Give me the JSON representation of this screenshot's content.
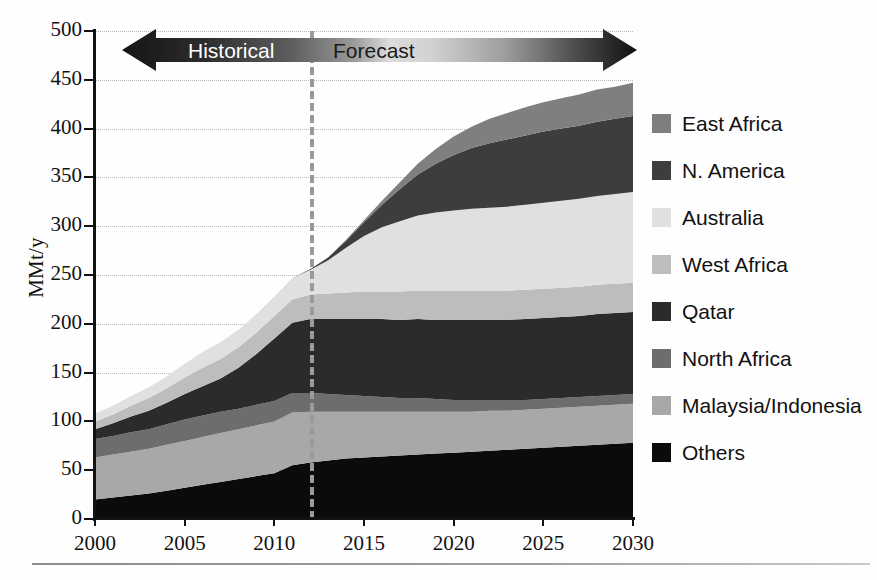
{
  "chart_data": {
    "type": "area",
    "title": "",
    "subtitle": "",
    "xlabel": "",
    "ylabel": "MMt/y",
    "xlim": [
      2000,
      2030
    ],
    "ylim": [
      0,
      500
    ],
    "grid": true,
    "legend_position": "right",
    "stacked": true,
    "x": [
      2000,
      2001,
      2002,
      2003,
      2004,
      2005,
      2006,
      2007,
      2008,
      2009,
      2010,
      2011,
      2012,
      2013,
      2014,
      2015,
      2016,
      2017,
      2018,
      2019,
      2020,
      2021,
      2022,
      2023,
      2024,
      2025,
      2026,
      2027,
      2028,
      2029,
      2030
    ],
    "y_ticks": [
      0,
      50,
      100,
      150,
      200,
      250,
      300,
      350,
      400,
      450,
      500
    ],
    "x_ticks": [
      2000,
      2005,
      2010,
      2015,
      2020,
      2025,
      2030
    ],
    "series": [
      {
        "name": "Others",
        "color": "#0b0b0b",
        "values": [
          20,
          22,
          24,
          26,
          29,
          32,
          35,
          38,
          41,
          44,
          47,
          55,
          58,
          60,
          62,
          63,
          64,
          65,
          66,
          67,
          68,
          69,
          70,
          71,
          72,
          73,
          74,
          75,
          76,
          77,
          78
        ]
      },
      {
        "name": "Malaysia/Indonesia",
        "color": "#a8a8a8",
        "values": [
          43,
          44,
          45,
          46,
          47,
          48,
          49,
          50,
          51,
          52,
          53,
          54,
          52,
          50,
          48,
          47,
          46,
          45,
          44,
          43,
          42,
          41,
          41,
          40,
          40,
          40,
          40,
          40,
          40,
          40,
          40
        ]
      },
      {
        "name": "North Africa",
        "color": "#6d6d6d",
        "values": [
          19,
          19,
          20,
          20,
          21,
          22,
          22,
          22,
          21,
          21,
          21,
          20,
          19,
          18,
          17,
          16,
          15,
          14,
          14,
          13,
          12,
          12,
          11,
          11,
          10,
          10,
          10,
          10,
          10,
          10,
          10
        ]
      },
      {
        "name": "Qatar",
        "color": "#2b2b2b",
        "values": [
          10,
          13,
          16,
          19,
          22,
          26,
          30,
          34,
          42,
          52,
          64,
          72,
          76,
          77,
          78,
          79,
          80,
          80,
          81,
          81,
          82,
          82,
          82,
          82,
          83,
          83,
          83,
          83,
          84,
          84,
          84
        ]
      },
      {
        "name": "West Africa",
        "color": "#bdbdbd",
        "values": [
          8,
          9,
          11,
          13,
          15,
          17,
          19,
          20,
          21,
          22,
          23,
          24,
          25,
          26,
          27,
          28,
          28,
          29,
          29,
          30,
          30,
          30,
          30,
          30,
          30,
          30,
          30,
          30,
          30,
          30,
          30
        ]
      },
      {
        "name": "Australia",
        "color": "#e0e0e0",
        "values": [
          8,
          9,
          10,
          11,
          12,
          14,
          16,
          17,
          18,
          19,
          20,
          22,
          25,
          34,
          46,
          57,
          66,
          72,
          77,
          80,
          82,
          84,
          85,
          86,
          87,
          88,
          89,
          90,
          91,
          92,
          93
        ]
      },
      {
        "name": "N. America",
        "color": "#3d3d3d",
        "values": [
          0,
          0,
          0,
          0,
          0,
          0,
          0,
          0,
          0,
          0,
          0,
          0,
          1,
          3,
          7,
          14,
          23,
          33,
          42,
          50,
          57,
          62,
          66,
          69,
          71,
          73,
          74,
          75,
          76,
          77,
          78
        ]
      },
      {
        "name": "East Africa",
        "color": "#7f7f7f",
        "values": [
          0,
          0,
          0,
          0,
          0,
          0,
          0,
          0,
          0,
          0,
          0,
          0,
          0,
          0,
          1,
          2,
          4,
          7,
          11,
          15,
          19,
          22,
          25,
          27,
          29,
          30,
          31,
          32,
          33,
          33,
          34
        ]
      }
    ],
    "annotations": {
      "divider_year": 2012,
      "historical_label": "Historical",
      "forecast_label": "Forecast"
    }
  },
  "axes": {
    "y_title": "MMt/y",
    "y_tick_labels": [
      "500",
      "450",
      "400",
      "350",
      "300",
      "250",
      "200",
      "150",
      "100",
      "50",
      "0"
    ],
    "x_tick_labels": [
      "2000",
      "2005",
      "2010",
      "2015",
      "2020",
      "2025",
      "2030"
    ]
  },
  "banner": {
    "historical": "Historical",
    "forecast": "Forecast"
  },
  "legend": {
    "items": [
      {
        "label": "East Africa",
        "color": "#7f7f7f"
      },
      {
        "label": "N. America",
        "color": "#3d3d3d"
      },
      {
        "label": "Australia",
        "color": "#e0e0e0"
      },
      {
        "label": "West Africa",
        "color": "#bdbdbd"
      },
      {
        "label": "Qatar",
        "color": "#2b2b2b"
      },
      {
        "label": "North Africa",
        "color": "#6d6d6d"
      },
      {
        "label": "Malaysia/Indonesia",
        "color": "#a8a8a8"
      },
      {
        "label": "Others",
        "color": "#0b0b0b"
      }
    ]
  },
  "footer": {
    "caption": ""
  }
}
